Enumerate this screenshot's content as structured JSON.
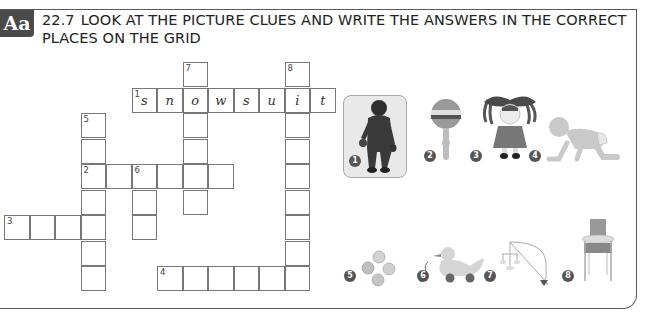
{
  "header": {
    "badge": "Aa",
    "exercise_number": "22.7",
    "instruction": "LOOK AT THE PICTURE CLUES AND WRITE THE ANSWERS IN THE CORRECT PLACES ON THE GRID"
  },
  "crossword": {
    "cell_size": 25.5,
    "origin": {
      "x": 4,
      "y": 62
    },
    "entries": [
      {
        "number": "1",
        "direction": "across",
        "row": 1,
        "col": 5,
        "length": 8,
        "letters": [
          "s",
          "n",
          "o",
          "w",
          "s",
          "u",
          "i",
          "t"
        ]
      },
      {
        "number": "2",
        "direction": "across",
        "row": 4,
        "col": 3,
        "length": 6,
        "letters": []
      },
      {
        "number": "3",
        "direction": "across",
        "row": 6,
        "col": 0,
        "length": 4,
        "letters": []
      },
      {
        "number": "4",
        "direction": "across",
        "row": 8,
        "col": 6,
        "length": 6,
        "letters": []
      },
      {
        "number": "5",
        "direction": "down",
        "row": 2,
        "col": 3,
        "length": 7,
        "letters": []
      },
      {
        "number": "6",
        "direction": "down",
        "row": 4,
        "col": 5,
        "length": 3,
        "letters": []
      },
      {
        "number": "7",
        "direction": "down",
        "row": 0,
        "col": 7,
        "length": 6,
        "letters": []
      },
      {
        "number": "8",
        "direction": "down",
        "row": 0,
        "col": 11,
        "length": 9,
        "letters": []
      }
    ]
  },
  "clues": [
    {
      "number": "1",
      "depicts": "child in snowsuit",
      "highlighted": true
    },
    {
      "number": "2",
      "depicts": "rattle"
    },
    {
      "number": "3",
      "depicts": "doll"
    },
    {
      "number": "4",
      "depicts": "crawling baby"
    },
    {
      "number": "5",
      "depicts": "marbles"
    },
    {
      "number": "6",
      "depicts": "pull-along duck toy"
    },
    {
      "number": "7",
      "depicts": "cot mobile"
    },
    {
      "number": "8",
      "depicts": "high chair"
    }
  ],
  "colors": {
    "badge": "#4a4a4a",
    "border": "#5a5a5a",
    "grid_line": "#777777",
    "highlight_bg": "#e9e9e9"
  }
}
